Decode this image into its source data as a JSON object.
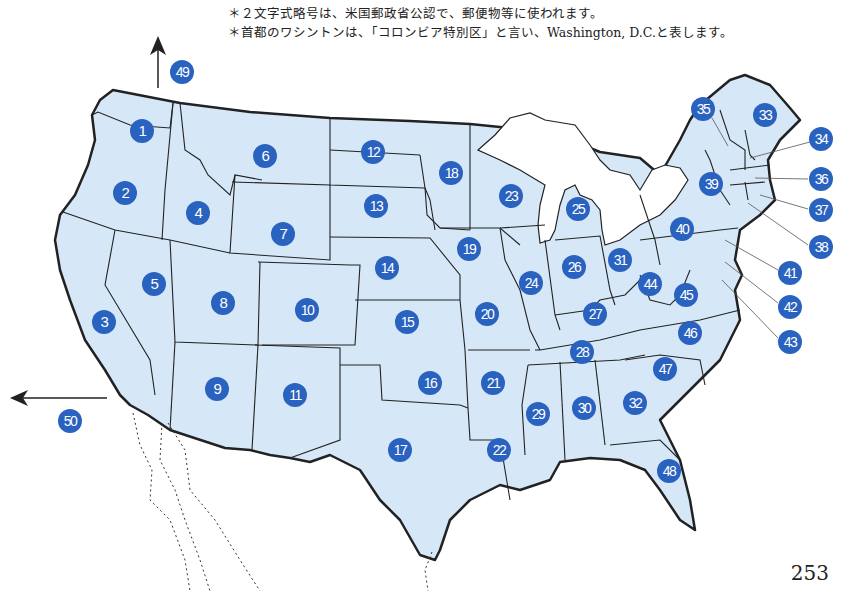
{
  "notes": {
    "line1": "＊２文字式略号は、米国郵政省公認で、郵便物等に使われます。",
    "line2": "＊首都のワシントンは、「コロンビア特別区」と言い、Washington, D.C.と表します。"
  },
  "page_number": "253",
  "colors": {
    "land": "#d6e8f7",
    "badge": "#2a62c0",
    "border": "#222222",
    "lakes": "#ffffff"
  },
  "offmap_arrows": [
    {
      "label": "49",
      "direction": "up"
    },
    {
      "label": "50",
      "direction": "left"
    }
  ],
  "states": [
    {
      "n": "1",
      "x": 142,
      "y": 131
    },
    {
      "n": "2",
      "x": 125,
      "y": 193
    },
    {
      "n": "3",
      "x": 104,
      "y": 322
    },
    {
      "n": "4",
      "x": 198,
      "y": 213
    },
    {
      "n": "5",
      "x": 154,
      "y": 284
    },
    {
      "n": "6",
      "x": 265,
      "y": 156
    },
    {
      "n": "7",
      "x": 283,
      "y": 234
    },
    {
      "n": "8",
      "x": 223,
      "y": 303
    },
    {
      "n": "9",
      "x": 217,
      "y": 389
    },
    {
      "n": "10",
      "x": 307,
      "y": 310
    },
    {
      "n": "11",
      "x": 295,
      "y": 395
    },
    {
      "n": "12",
      "x": 373,
      "y": 152
    },
    {
      "n": "13",
      "x": 376,
      "y": 206
    },
    {
      "n": "14",
      "x": 387,
      "y": 268
    },
    {
      "n": "15",
      "x": 407,
      "y": 322
    },
    {
      "n": "16",
      "x": 430,
      "y": 383
    },
    {
      "n": "17",
      "x": 400,
      "y": 450
    },
    {
      "n": "18",
      "x": 451,
      "y": 173
    },
    {
      "n": "19",
      "x": 469,
      "y": 249
    },
    {
      "n": "20",
      "x": 487,
      "y": 314
    },
    {
      "n": "21",
      "x": 493,
      "y": 383
    },
    {
      "n": "22",
      "x": 499,
      "y": 450
    },
    {
      "n": "23",
      "x": 511,
      "y": 196
    },
    {
      "n": "24",
      "x": 531,
      "y": 283
    },
    {
      "n": "25",
      "x": 578,
      "y": 209
    },
    {
      "n": "26",
      "x": 574,
      "y": 267
    },
    {
      "n": "27",
      "x": 595,
      "y": 314
    },
    {
      "n": "28",
      "x": 582,
      "y": 352
    },
    {
      "n": "29",
      "x": 538,
      "y": 414
    },
    {
      "n": "30",
      "x": 584,
      "y": 408
    },
    {
      "n": "31",
      "x": 620,
      "y": 260
    },
    {
      "n": "32",
      "x": 635,
      "y": 403
    },
    {
      "n": "33",
      "x": 765,
      "y": 115
    },
    {
      "n": "34",
      "x": 821,
      "y": 139
    },
    {
      "n": "35",
      "x": 703,
      "y": 109
    },
    {
      "n": "36",
      "x": 821,
      "y": 179
    },
    {
      "n": "37",
      "x": 821,
      "y": 210
    },
    {
      "n": "38",
      "x": 821,
      "y": 247
    },
    {
      "n": "39",
      "x": 711,
      "y": 184
    },
    {
      "n": "40",
      "x": 682,
      "y": 229
    },
    {
      "n": "41",
      "x": 790,
      "y": 273
    },
    {
      "n": "42",
      "x": 790,
      "y": 307
    },
    {
      "n": "43",
      "x": 790,
      "y": 342
    },
    {
      "n": "44",
      "x": 650,
      "y": 284
    },
    {
      "n": "45",
      "x": 686,
      "y": 295
    },
    {
      "n": "46",
      "x": 690,
      "y": 333
    },
    {
      "n": "47",
      "x": 665,
      "y": 369
    },
    {
      "n": "48",
      "x": 669,
      "y": 471
    },
    {
      "n": "49",
      "x": 182,
      "y": 72
    },
    {
      "n": "50",
      "x": 70,
      "y": 421
    }
  ]
}
